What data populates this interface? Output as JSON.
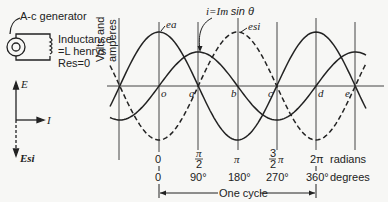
{
  "circuit": {
    "generator_label": "A-c generator",
    "inductance_label_line1": "Inductance",
    "inductance_label_line2": "=L henrys",
    "resistance_label": "Res=0"
  },
  "phasor": {
    "e_label": "E",
    "i_label": "I",
    "esi_label": "Esi"
  },
  "chart_data": {
    "type": "line",
    "title": "",
    "ylabel": "Volts and amperes",
    "xlabel": "One cycle",
    "equation_label": "i = Im sin θ",
    "series": [
      {
        "name": "ea",
        "style": "solid",
        "function": "cos θ",
        "relative_amplitude": 1.0
      },
      {
        "name": "i",
        "style": "solid",
        "function": "sin θ",
        "relative_amplitude": 0.63
      },
      {
        "name": "esi",
        "style": "dashed",
        "function": "-cos θ",
        "relative_amplitude": 1.0
      }
    ],
    "point_labels": [
      "o",
      "a",
      "b",
      "c",
      "d",
      "e"
    ],
    "x_ticks_radians": [
      "0",
      "π/2",
      "π",
      "3/2 π",
      "2π"
    ],
    "x_ticks_degrees": [
      "0",
      "90°",
      "180°",
      "270°",
      "360°"
    ],
    "x_unit_radians": "radians",
    "x_unit_degrees": "degrees",
    "grid": false
  },
  "labels": {
    "ea": "ea",
    "esi": "esi",
    "eq_i": "i=",
    "eq_Im": "Im",
    "eq_sin": "sin θ",
    "y_axis_line1": "Volts and",
    "y_axis_line2": "amperes",
    "pt_o": "o",
    "pt_a": "a",
    "pt_b": "b",
    "pt_c": "c",
    "pt_d": "d",
    "pt_e": "e",
    "rad_0": "0",
    "rad_pi2_num": "π",
    "rad_pi2_den": "2",
    "rad_pi": "π",
    "rad_3pi2": "3",
    "rad_3pi2_den": "2",
    "rad_3pi2_pi": "π",
    "rad_2pi": "2π",
    "rad_unit": "radians",
    "deg_0": "0",
    "deg_90": "90°",
    "deg_180": "180°",
    "deg_270": "270°",
    "deg_360": "360°",
    "deg_unit": "degrees",
    "one_cycle": "One cycle"
  }
}
